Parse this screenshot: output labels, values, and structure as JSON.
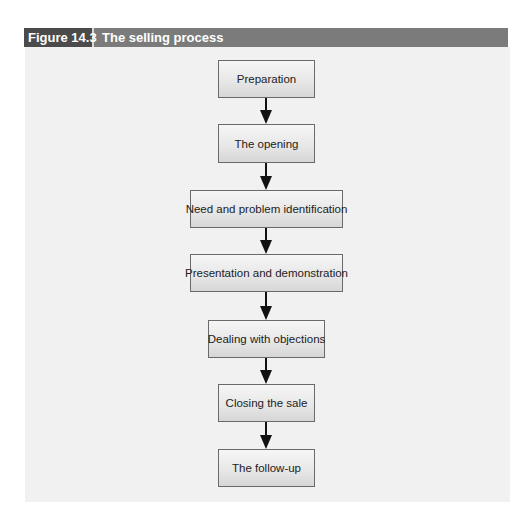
{
  "figure": {
    "label": "Figure 14.3",
    "title": "The selling process"
  },
  "colors": {
    "label_bg": "#4b4b4b",
    "title_bar_bg": "#7b7b7b",
    "panel_bg": "#f1f1f1",
    "box_border": "#6a6a6a",
    "arrow": "#111111"
  },
  "flowchart": {
    "direction": "top-to-bottom",
    "steps": [
      {
        "label": "Preparation"
      },
      {
        "label": "The opening"
      },
      {
        "label": "Need and problem identification"
      },
      {
        "label": "Presentation and demonstration"
      },
      {
        "label": "Dealing with objections"
      },
      {
        "label": "Closing the sale"
      },
      {
        "label": "The follow-up"
      }
    ],
    "edges": [
      {
        "from": "Preparation",
        "to": "The opening"
      },
      {
        "from": "The opening",
        "to": "Need and problem identification"
      },
      {
        "from": "Need and problem identification",
        "to": "Presentation and demonstration"
      },
      {
        "from": "Presentation and demonstration",
        "to": "Dealing with objections"
      },
      {
        "from": "Dealing with objections",
        "to": "Closing the sale"
      },
      {
        "from": "Closing the sale",
        "to": "The follow-up"
      }
    ]
  }
}
